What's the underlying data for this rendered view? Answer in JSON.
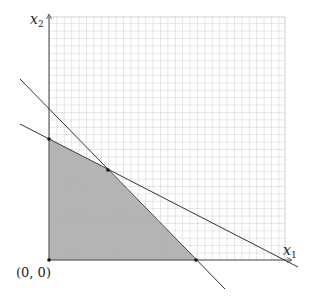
{
  "diagram": {
    "type": "linear-programming-feasible-region",
    "axes": {
      "x_label": "x",
      "x_sub": "1",
      "y_label": "x",
      "y_sub": "2",
      "origin_label": "(0, 0)"
    },
    "grid": {
      "x0": 49,
      "y0": 260,
      "x1": 285,
      "y1": 17,
      "step": 7.4,
      "color": "#a8a8a8"
    },
    "constraints": [
      {
        "name": "steep-constraint-line",
        "from": [
          20,
          79
        ],
        "to": [
          225,
          289
        ]
      },
      {
        "name": "shallow-constraint-line",
        "from": [
          20,
          124
        ],
        "to": [
          298,
          267
        ]
      }
    ],
    "feasible_region": {
      "vertices": [
        [
          49,
          260
        ],
        [
          49,
          139
        ],
        [
          108,
          170
        ],
        [
          196,
          260
        ]
      ],
      "fill": "#aaaaaa"
    },
    "points": [
      {
        "name": "origin-point",
        "at": [
          49,
          260
        ]
      },
      {
        "name": "y-intercept-vertex",
        "at": [
          49,
          139
        ]
      },
      {
        "name": "intersection-vertex",
        "at": [
          108,
          170
        ]
      },
      {
        "name": "x-intercept-vertex",
        "at": [
          196,
          260
        ]
      }
    ],
    "line_color": "#333333"
  }
}
